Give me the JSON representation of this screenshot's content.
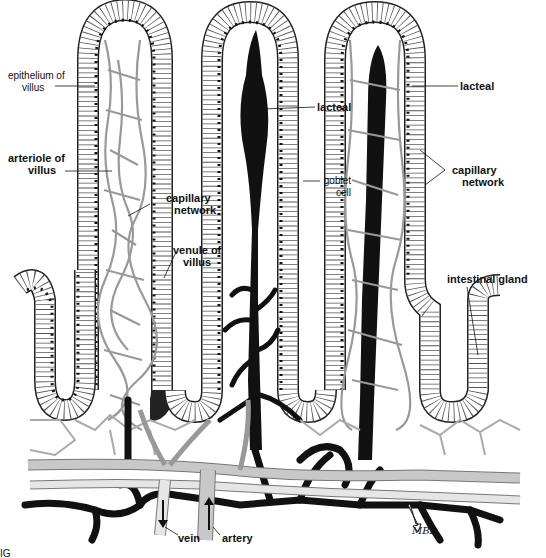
{
  "figure": {
    "signature": "MBL",
    "partial_caption": "IG"
  },
  "labels": {
    "epithelium_of_villus": [
      "epithelium of",
      "villus"
    ],
    "arteriole_of_villus": [
      "arteriole of",
      "villus"
    ],
    "capillary_network_left": [
      "capillary",
      "network"
    ],
    "venule_of_villus": [
      "venule of",
      "villus"
    ],
    "lacteal_center": "lacteal",
    "goblet_cell": [
      "goblet",
      "cell"
    ],
    "lacteal_right": "lacteal",
    "capillary_network_right": [
      "capillary",
      "network"
    ],
    "intestinal_gland": "intestinal gland",
    "vein": "vein",
    "artery": "artery"
  },
  "colors": {
    "ink": "#111111",
    "vessel_gray": "#c8c8c8",
    "vessel_light": "#e6e6e6",
    "background": "#ffffff"
  }
}
